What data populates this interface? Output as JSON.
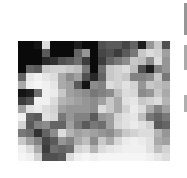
{
  "image": {
    "description": "Pixelated grayscale image, 19x15 blocks",
    "cols": 19,
    "rows": 15,
    "pixels": [
      [
        10,
        10,
        20,
        220,
        10,
        10,
        10,
        30,
        10,
        10,
        80,
        90,
        90,
        70,
        100,
        30,
        150,
        200,
        80
      ],
      [
        10,
        10,
        10,
        90,
        10,
        10,
        10,
        100,
        150,
        10,
        70,
        80,
        60,
        90,
        120,
        200,
        220,
        210,
        160
      ],
      [
        10,
        10,
        10,
        40,
        50,
        80,
        90,
        110,
        60,
        10,
        60,
        100,
        120,
        140,
        200,
        190,
        140,
        220,
        150
      ],
      [
        10,
        100,
        90,
        200,
        210,
        210,
        200,
        190,
        120,
        10,
        110,
        200,
        210,
        220,
        190,
        80,
        30,
        130,
        150
      ],
      [
        100,
        230,
        240,
        230,
        220,
        170,
        140,
        160,
        80,
        40,
        100,
        200,
        210,
        200,
        130,
        130,
        140,
        200,
        120
      ],
      [
        170,
        240,
        245,
        240,
        230,
        170,
        160,
        90,
        20,
        140,
        130,
        220,
        210,
        225,
        210,
        150,
        200,
        190,
        180
      ],
      [
        20,
        30,
        110,
        240,
        235,
        200,
        160,
        150,
        140,
        120,
        130,
        140,
        190,
        220,
        215,
        140,
        150,
        200,
        170
      ],
      [
        60,
        80,
        240,
        240,
        220,
        180,
        170,
        160,
        150,
        140,
        160,
        200,
        170,
        225,
        230,
        200,
        210,
        220,
        180
      ],
      [
        160,
        225,
        235,
        220,
        210,
        160,
        150,
        150,
        150,
        140,
        220,
        200,
        170,
        210,
        235,
        220,
        170,
        130,
        160
      ],
      [
        240,
        100,
        90,
        225,
        215,
        120,
        150,
        130,
        130,
        90,
        150,
        160,
        210,
        225,
        230,
        190,
        120,
        100,
        120
      ],
      [
        210,
        90,
        130,
        140,
        100,
        100,
        160,
        120,
        90,
        120,
        110,
        160,
        215,
        225,
        235,
        225,
        210,
        90,
        100
      ],
      [
        120,
        110,
        50,
        100,
        140,
        220,
        180,
        160,
        170,
        160,
        150,
        140,
        170,
        200,
        210,
        220,
        220,
        180,
        150
      ],
      [
        200,
        160,
        130,
        70,
        90,
        150,
        130,
        170,
        190,
        140,
        200,
        170,
        215,
        235,
        240,
        235,
        225,
        170,
        160
      ],
      [
        240,
        220,
        170,
        60,
        110,
        100,
        110,
        210,
        220,
        180,
        220,
        230,
        235,
        240,
        240,
        240,
        225,
        190,
        210
      ],
      [
        245,
        240,
        210,
        80,
        80,
        90,
        220,
        240,
        245,
        240,
        245,
        245,
        245,
        245,
        245,
        245,
        240,
        230,
        220
      ]
    ]
  },
  "edge_strip": {
    "segments": [
      {
        "top": 3,
        "height": 32,
        "gray": 150
      },
      {
        "top": 45,
        "height": 25,
        "gray": 170
      },
      {
        "top": 95,
        "height": 17,
        "gray": 175
      }
    ]
  }
}
